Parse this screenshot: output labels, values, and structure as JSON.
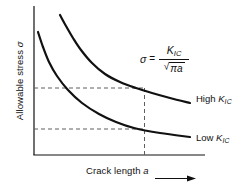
{
  "figure": {
    "kind": "textbook-line-chart",
    "background": "#ffffff",
    "line_color": "#111111",
    "dash_color": "#6b6b6b"
  },
  "axes": {
    "ylabel_text": "Allowable stress ",
    "ylabel_symbol": "σ",
    "xlabel_text": "Crack length ",
    "xlabel_symbol": "a",
    "xarrow_icon": "right-arrow-icon",
    "x_ticks": [],
    "y_ticks": []
  },
  "formula": {
    "lhs": "σ",
    "equals": "=",
    "numerator": "K",
    "numerator_sub": "IC",
    "denominator_radical": "√",
    "denominator_radicand": "πa",
    "plain": "σ = K_IC / √(πa)"
  },
  "annotations": {
    "high_label": "High ",
    "high_symbol": "K",
    "high_sub": "IC",
    "low_label": "Low ",
    "low_symbol": "K",
    "low_sub": "IC"
  },
  "chart_data": {
    "type": "line",
    "title": "",
    "subtitle": "",
    "xlabel": "Crack length a",
    "ylabel": "Allowable stress σ",
    "xlim": [
      0,
      1
    ],
    "ylim": [
      0,
      1
    ],
    "grid": false,
    "axis_ticks_shown": false,
    "legend": "inline-right-of-curves",
    "annotation_formula": "σ = K_IC / √(πa)",
    "series": [
      {
        "name": "High K_IC",
        "label": "High K_IC",
        "color": "#111111",
        "points_px": [
          [
            60,
            15
          ],
          [
            66,
            26
          ],
          [
            73,
            38
          ],
          [
            81,
            50
          ],
          [
            92,
            63
          ],
          [
            105,
            74
          ],
          [
            120,
            82
          ],
          [
            136,
            88
          ],
          [
            152,
            93
          ],
          [
            170,
            98
          ],
          [
            190,
            103
          ]
        ],
        "start_px": [
          60,
          15
        ],
        "end_px": [
          190,
          103
        ],
        "intersection_px": [
          144,
          90
        ]
      },
      {
        "name": "Low K_IC",
        "label": "Low K_IC",
        "color": "#111111",
        "points_px": [
          [
            38,
            32
          ],
          [
            43,
            47
          ],
          [
            49,
            62
          ],
          [
            57,
            76
          ],
          [
            68,
            90
          ],
          [
            82,
            103
          ],
          [
            99,
            114
          ],
          [
            116,
            122
          ],
          [
            134,
            128
          ],
          [
            160,
            133
          ],
          [
            190,
            137
          ]
        ],
        "start_px": [
          38,
          32
        ],
        "end_px": [
          190,
          137
        ],
        "intersection_px": [
          144,
          130
        ]
      }
    ],
    "guides": [
      {
        "name": "vertical-dashed-crack-length",
        "orientation": "vertical",
        "x_px": 144,
        "y_from_px": 88,
        "y_to_px": 155,
        "style": "dashed"
      },
      {
        "name": "horizontal-dashed-high-stress",
        "orientation": "horizontal",
        "y_px": 88,
        "x_from_px": 34,
        "x_to_px": 146,
        "style": "dashed"
      },
      {
        "name": "horizontal-dashed-low-stress",
        "orientation": "horizontal",
        "y_px": 129,
        "x_from_px": 34,
        "x_to_px": 146,
        "style": "dashed"
      }
    ],
    "axis_lines": {
      "y_axis_px": {
        "x": 34,
        "y_top": 6,
        "y_bottom": 155
      },
      "x_axis_px": {
        "y": 155,
        "x_left": 34,
        "x_right": 205
      }
    }
  }
}
